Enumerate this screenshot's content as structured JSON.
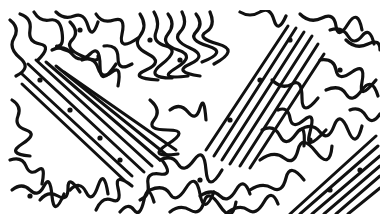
{
  "image": {
    "description": "Black and white labyrinthine stripe pattern (Turing/fingerprint-like texture) with diagonal parallel stripe bands",
    "colors": {
      "stripe": "#111111",
      "background": "#ffffff"
    },
    "pattern_bounds": {
      "x": 8,
      "y": 10,
      "width": 372,
      "height": 204
    },
    "diagonal_bands": [
      {
        "region": "left",
        "from": [
          28,
          75
        ],
        "to": [
          140,
          175
        ]
      },
      {
        "region": "upper-center",
        "from": [
          215,
          150
        ],
        "to": [
          300,
          20
        ]
      },
      {
        "region": "lower-right",
        "from": [
          300,
          210
        ],
        "to": [
          378,
          140
        ]
      }
    ]
  }
}
